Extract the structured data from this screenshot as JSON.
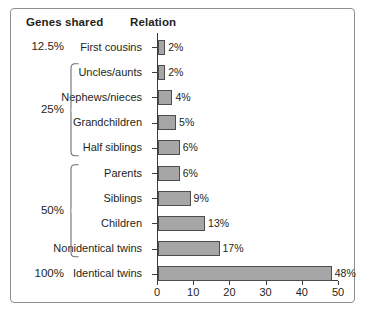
{
  "headers": {
    "genes_shared": "Genes shared",
    "relation": "Relation"
  },
  "chart_data": {
    "type": "bar",
    "orientation": "horizontal",
    "title": "",
    "subtitle": "",
    "xlabel": "",
    "ylabel": "",
    "xlim": [
      0,
      50
    ],
    "xticks": [
      0,
      10,
      20,
      30,
      40,
      50
    ],
    "xticklabels": [
      "0",
      "10",
      "20",
      "30",
      "40",
      "50"
    ],
    "grid": false,
    "legend": false,
    "bar_color": "#a6a6a6",
    "bar_edge_color": "#4d4d4d",
    "categories": [
      "First cousins",
      "Uncles/aunts",
      "Nephews/nieces",
      "Grandchildren",
      "Half siblings",
      "Parents",
      "Siblings",
      "Children",
      "Nonidentical twins",
      "Identical twins"
    ],
    "values": [
      2,
      2,
      4,
      5,
      6,
      6,
      9,
      13,
      17,
      48
    ],
    "value_labels": [
      "2%",
      "2%",
      "4%",
      "5%",
      "6%",
      "6%",
      "9%",
      "13%",
      "17%",
      "48%"
    ],
    "groups": [
      {
        "label": "12.5%",
        "members": [
          "First cousins"
        ],
        "brace": false
      },
      {
        "label": "25%",
        "members": [
          "Uncles/aunts",
          "Nephews/nieces",
          "Grandchildren",
          "Half siblings"
        ],
        "brace": true
      },
      {
        "label": "50%",
        "members": [
          "Parents",
          "Siblings",
          "Children",
          "Nonidentical twins"
        ],
        "brace": true
      },
      {
        "label": "100%",
        "members": [
          "Identical twins"
        ],
        "brace": false
      }
    ]
  }
}
